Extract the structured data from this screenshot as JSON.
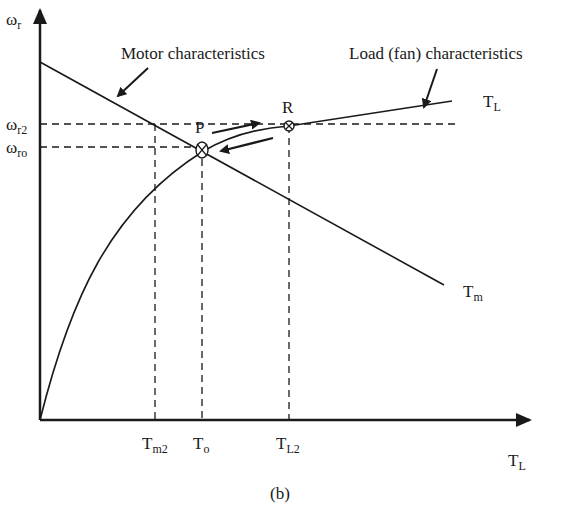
{
  "figure": {
    "caption": "(b)",
    "axes": {
      "y_symbol": "ω",
      "y_sub": "r",
      "x_symbol": "T",
      "x_sub": "L"
    },
    "y_ticks": [
      {
        "symbol": "ω",
        "sub": "r2"
      },
      {
        "symbol": "ω",
        "sub": "ro"
      }
    ],
    "x_ticks": [
      {
        "symbol": "T",
        "sub": "m2"
      },
      {
        "symbol": "T",
        "sub": "o"
      },
      {
        "symbol": "T",
        "sub": "L2"
      }
    ],
    "annotations": {
      "motor": "Motor characteristics",
      "load": "Load (fan) characteristics",
      "point_p": "P",
      "point_r": "R"
    },
    "curve_labels": {
      "load": {
        "symbol": "T",
        "sub": "L"
      },
      "motor": {
        "symbol": "T",
        "sub": "m"
      }
    },
    "colors": {
      "line": "#1a1a1a",
      "background": "#ffffff"
    }
  }
}
